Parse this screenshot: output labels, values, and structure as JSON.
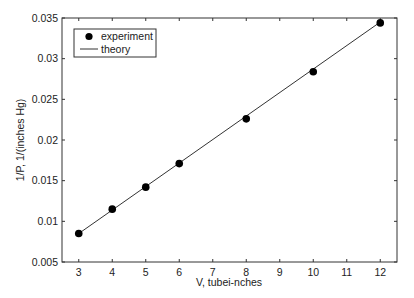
{
  "chart_data": {
    "type": "scatter",
    "title": "",
    "xlabel": "V, tubei-nches",
    "ylabel": "1/P, 1/(inches Hg)",
    "xlim": [
      2.5,
      12.5
    ],
    "ylim": [
      0.005,
      0.035
    ],
    "xticks": [
      3,
      4,
      5,
      6,
      7,
      8,
      9,
      10,
      11,
      12
    ],
    "xtick_labels": [
      "3",
      "4",
      "5",
      "6",
      "7",
      "8",
      "9",
      "10",
      "11",
      "12"
    ],
    "yticks": [
      0.005,
      0.01,
      0.015,
      0.02,
      0.025,
      0.03,
      0.035
    ],
    "ytick_labels": [
      "0.005",
      "0.01",
      "0.015",
      "0.02",
      "0.025",
      "0.03",
      "0.035"
    ],
    "grid": false,
    "legend_position": "upper left",
    "series": [
      {
        "name": "experiment",
        "kind": "markers",
        "marker": "filled-circle",
        "color": "#000000",
        "x": [
          3,
          4,
          5,
          6,
          8,
          10,
          12
        ],
        "y": [
          0.0085,
          0.0115,
          0.0142,
          0.0171,
          0.0226,
          0.0284,
          0.0344
        ]
      },
      {
        "name": "theory",
        "kind": "line",
        "color": "#000000",
        "x": [
          3,
          12
        ],
        "y": [
          0.0085,
          0.0345
        ]
      }
    ]
  },
  "legend": {
    "items": [
      {
        "label": "experiment"
      },
      {
        "label": "theory"
      }
    ]
  }
}
